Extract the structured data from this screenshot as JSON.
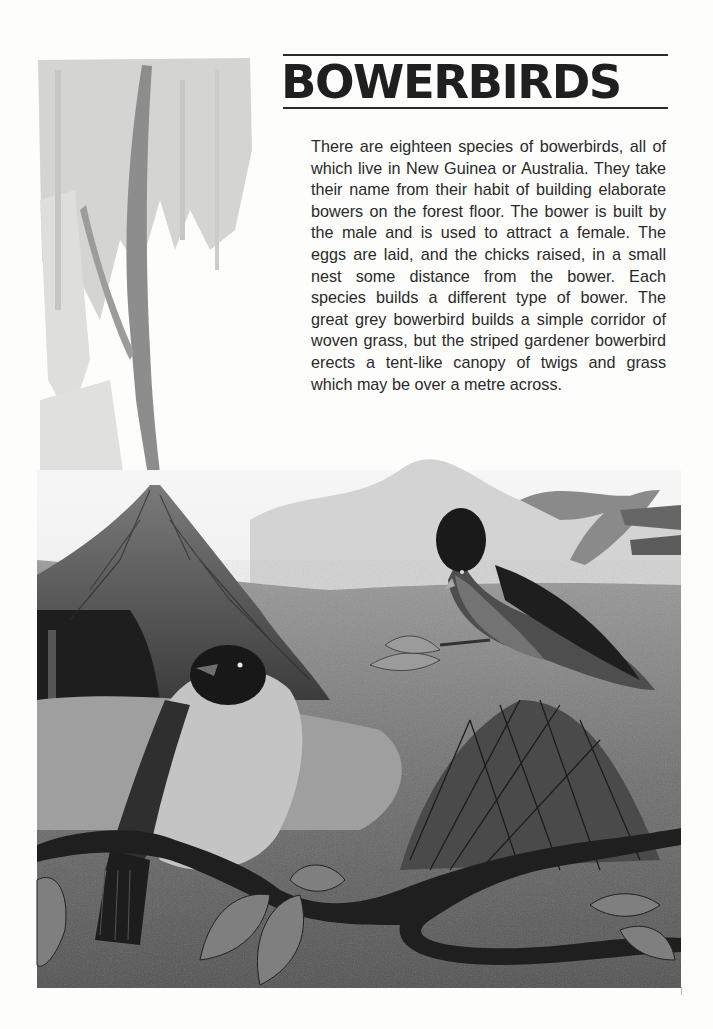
{
  "page": {
    "title": "BOWERBIRDS",
    "paragraph": "There are eighteen species of bowerbirds, all of which live in New Guinea or Australia. They take their name from their habit of building elaborate bowers on the forest floor. The bower is built by the male and is used to attract a female. The eggs are laid, and the chicks raised, in a small nest some distance from the bower. Each species builds a different type of bower. The great grey bowerbird builds a simple corridor of woven grass, but the striped gardener bowerbird erects a tent-like canopy of twigs and grass which may be over a metre across.",
    "illustration": {
      "description": "Greyscale painting of two bowerbirds: one in front of a thatched tent-like bower under a tree, a crested bird perched above a grass bower, with a twisting vine branch and leaves in the foreground",
      "style": "greyscale",
      "colors": {
        "paper": "#fdfdfc",
        "ink": "#1f1f1f",
        "dark": "#2b2b2b",
        "mid": "#6e6e6e",
        "light": "#b9b9b9",
        "sky": "#eeeeee"
      }
    }
  }
}
